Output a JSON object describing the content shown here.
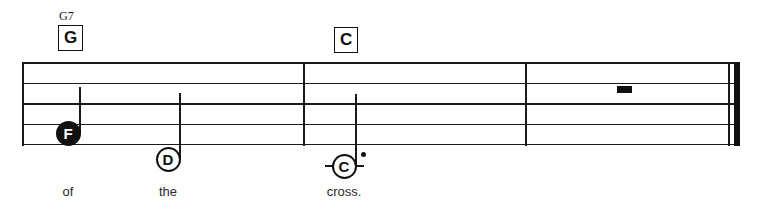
{
  "sheet": {
    "system_label": "single-staff-system",
    "staff": {
      "line_count": 5,
      "left": 22,
      "right": 740,
      "top": 62,
      "bottom": 145,
      "line_spacing": 20.5,
      "color": "#1a1a1a"
    },
    "chords": [
      {
        "id": "chord-g",
        "superscript": "G7",
        "box_label": "G",
        "x": 58,
        "y": 10
      },
      {
        "id": "chord-c",
        "superscript": "",
        "box_label": "C",
        "x": 334,
        "y": 27
      }
    ],
    "barlines": [
      {
        "id": "barline-1",
        "x": 303,
        "type": "single"
      },
      {
        "id": "barline-2",
        "x": 525,
        "type": "single"
      },
      {
        "id": "barline-final-thin",
        "x": 730,
        "type": "single"
      },
      {
        "id": "barline-final-thick",
        "x": 735,
        "type": "thick"
      }
    ],
    "notes": [
      {
        "id": "note-f",
        "letter": "F",
        "head_style": "filled",
        "cx": 68,
        "cy": 133,
        "stem": {
          "direction": "up",
          "height": 46
        },
        "ledger": false,
        "dotted": false
      },
      {
        "id": "note-d",
        "letter": "D",
        "head_style": "open",
        "cx": 168,
        "cy": 159,
        "stem": {
          "direction": "up",
          "height": 66
        },
        "ledger": false,
        "dotted": false
      },
      {
        "id": "note-c",
        "letter": "C",
        "head_style": "open",
        "cx": 344,
        "cy": 166,
        "stem": {
          "direction": "up",
          "height": 72
        },
        "ledger": true,
        "ledger_width": 38,
        "dotted": true
      }
    ],
    "rests": [
      {
        "id": "rest-half",
        "type": "half-rest",
        "x": 617,
        "y": 86,
        "width": 15,
        "height": 7
      }
    ],
    "lyrics": [
      {
        "id": "lyric-of",
        "text": "of",
        "x": 68,
        "y": 184
      },
      {
        "id": "lyric-the",
        "text": "the",
        "x": 168,
        "y": 184
      },
      {
        "id": "lyric-cross",
        "text": "cross.",
        "x": 344,
        "y": 184
      }
    ]
  }
}
